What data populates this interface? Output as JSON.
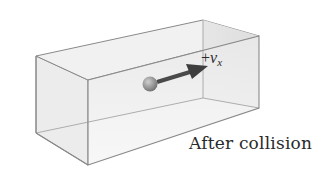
{
  "figure": {
    "caption": "After collision",
    "velocity_label": {
      "sign": "+",
      "symbol": "v",
      "subscript": "x"
    },
    "elements": {
      "box": "transparent rectangular container (perspective view)",
      "particle": "molecule sphere",
      "arrow": "velocity vector pointing in +x direction"
    },
    "colors": {
      "box_edge": "#8a8a8a",
      "box_face_front": "#efefef",
      "box_face_side": "#e4e4e4",
      "box_face_top": "#f3f3f3",
      "ball": "#8f8f8f",
      "arrow": "#4a4a4a",
      "text": "#2a2a2a"
    }
  }
}
